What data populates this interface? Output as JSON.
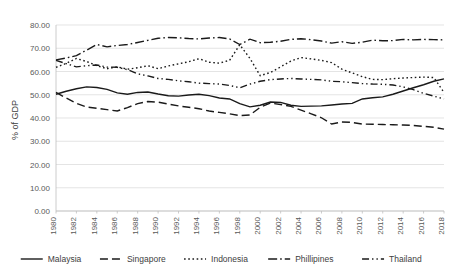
{
  "chart_data": {
    "type": "line",
    "title": "",
    "xlabel": "",
    "ylabel": "% of GDP",
    "ylim": [
      0,
      80
    ],
    "ytick_labels": [
      "0.00",
      "10.00",
      "20.00",
      "30.00",
      "40.00",
      "50.00",
      "60.00",
      "70.00",
      "80.00"
    ],
    "ytick_values": [
      0,
      10,
      20,
      30,
      40,
      50,
      60,
      70,
      80
    ],
    "grid": true,
    "legend_position": "bottom",
    "x": [
      1980,
      1981,
      1982,
      1983,
      1984,
      1985,
      1986,
      1987,
      1988,
      1989,
      1990,
      1991,
      1992,
      1993,
      1994,
      1995,
      1996,
      1997,
      1998,
      1999,
      2000,
      2001,
      2002,
      2003,
      2004,
      2005,
      2006,
      2007,
      2008,
      2009,
      2010,
      2011,
      2012,
      2013,
      2014,
      2015,
      2016,
      2017,
      2018
    ],
    "xtick_labels": [
      "1980",
      "1982",
      "1984",
      "1986",
      "1988",
      "1990",
      "1992",
      "1994",
      "1996",
      "1998",
      "2000",
      "2002",
      "2004",
      "2006",
      "2008",
      "2010",
      "2012",
      "2014",
      "2016",
      "2018"
    ],
    "series": [
      {
        "name": "Malaysia",
        "dash": "none",
        "values": [
          50.2,
          51.5,
          52.6,
          53.4,
          53.1,
          52.3,
          50.8,
          50.2,
          51.0,
          51.2,
          50.3,
          49.6,
          49.4,
          49.9,
          50.2,
          49.6,
          48.6,
          48.2,
          46.2,
          44.8,
          45.5,
          46.9,
          46.7,
          45.5,
          45.0,
          45.1,
          45.2,
          45.6,
          46.0,
          46.3,
          48.2,
          48.7,
          49.1,
          50.2,
          51.6,
          53.0,
          54.3,
          55.8,
          56.8
        ]
      },
      {
        "name": "Singapore",
        "dash": "8,4",
        "values": [
          51.0,
          48.6,
          46.3,
          44.7,
          44.2,
          43.6,
          43.0,
          44.5,
          46.2,
          47.1,
          46.8,
          46.0,
          45.2,
          44.6,
          44.0,
          43.0,
          42.4,
          41.8,
          41.0,
          41.3,
          44.6,
          46.4,
          45.8,
          45.0,
          43.4,
          41.8,
          40.1,
          37.4,
          38.3,
          38.1,
          37.4,
          37.3,
          37.2,
          37.1,
          37.0,
          36.8,
          36.4,
          36.0,
          35.2
        ]
      },
      {
        "name": "Indonesia",
        "dash": "1.6,2.6",
        "values": [
          61.8,
          63.5,
          65.6,
          64.3,
          62.5,
          61.2,
          62.0,
          61.0,
          61.6,
          62.5,
          61.2,
          62.4,
          63.3,
          64.2,
          65.5,
          64.0,
          63.6,
          64.8,
          71.5,
          65.6,
          58.2,
          59.6,
          62.0,
          64.5,
          66.0,
          65.4,
          64.8,
          63.8,
          61.0,
          59.4,
          57.8,
          56.6,
          56.5,
          56.9,
          57.2,
          57.4,
          57.6,
          57.4,
          51.0
        ]
      },
      {
        "name": "Phillipines",
        "dash": "9,3,1.6,3",
        "values": [
          65.0,
          65.8,
          66.8,
          69.2,
          71.6,
          70.6,
          71.2,
          71.6,
          72.5,
          73.4,
          74.3,
          74.6,
          74.5,
          74.2,
          74.0,
          74.4,
          74.6,
          74.0,
          71.6,
          73.9,
          72.4,
          72.6,
          73.0,
          73.8,
          74.1,
          73.7,
          73.1,
          72.2,
          72.8,
          72.1,
          72.6,
          73.5,
          73.2,
          73.3,
          73.8,
          73.6,
          73.8,
          73.7,
          73.6
        ]
      },
      {
        "name": "Thailand",
        "dash": "7,3,1.4,3,1.4,3",
        "values": [
          64.8,
          63.4,
          62.0,
          62.5,
          62.8,
          61.9,
          61.8,
          60.8,
          59.0,
          58.1,
          57.0,
          56.6,
          56.0,
          55.6,
          55.0,
          54.8,
          54.6,
          54.0,
          53.0,
          54.6,
          55.8,
          56.5,
          56.8,
          57.0,
          56.8,
          56.6,
          56.4,
          55.8,
          55.6,
          55.2,
          54.8,
          54.6,
          54.5,
          54.2,
          53.4,
          52.2,
          50.6,
          49.4,
          48.2
        ]
      }
    ]
  }
}
